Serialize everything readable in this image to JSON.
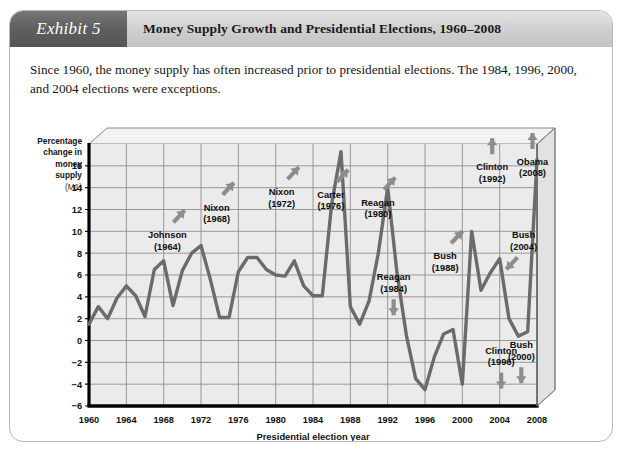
{
  "exhibit": {
    "badge_label": "Exhibit 5",
    "title": "Money Supply Growth and Presidential Elections, 1960–2008",
    "caption": "Since 1960, the money supply has often increased prior to presidential elections. The 1984, 1996, 2000, and 2004 elections were exceptions.",
    "badge_color": "#5e5e5e",
    "band_color": "#d2d2d2"
  },
  "chart_data": {
    "type": "line",
    "title": "Money Supply Growth and Presidential Elections, 1960–2008",
    "subtitle": "",
    "xlabel": "Presidential election year",
    "ylabel": "Percentage change in money supply (M1)",
    "ylabel_lines": [
      "Percentage",
      "change in",
      "money",
      "supply",
      "(M1)"
    ],
    "xlim": [
      1960,
      2008
    ],
    "ylim": [
      -6,
      18
    ],
    "xticks": [
      1960,
      1964,
      1968,
      1972,
      1976,
      1980,
      1984,
      1988,
      1992,
      1996,
      2000,
      2004,
      2008
    ],
    "yticks": [
      -6,
      -4,
      -2,
      0,
      2,
      4,
      6,
      8,
      10,
      12,
      14,
      16
    ],
    "grid": true,
    "legend": "none",
    "line_color": "#6b6b6b",
    "plot_bg": "#ebebeb",
    "series": [
      {
        "name": "Percentage change in money supply (M1)",
        "x": [
          1960,
          1961,
          1962,
          1963,
          1964,
          1965,
          1966,
          1967,
          1968,
          1969,
          1970,
          1971,
          1972,
          1973,
          1974,
          1975,
          1976,
          1977,
          1978,
          1979,
          1980,
          1981,
          1982,
          1983,
          1984,
          1985,
          1986,
          1987,
          1988,
          1989,
          1990,
          1991,
          1992,
          1993,
          1994,
          1995,
          1996,
          1997,
          1998,
          1999,
          2000,
          2001,
          2002,
          2003,
          2004,
          2005,
          2006,
          2007,
          2008
        ],
        "values": [
          1.5,
          3.1,
          2.0,
          3.9,
          5.0,
          4.1,
          2.2,
          6.5,
          7.3,
          3.2,
          6.4,
          8.0,
          8.7,
          5.6,
          2.1,
          2.1,
          6.3,
          7.6,
          7.6,
          6.5,
          6.0,
          5.9,
          7.3,
          5.0,
          4.1,
          4.1,
          12.5,
          17.3,
          3.1,
          1.5,
          3.6,
          8.0,
          14.0,
          6.2,
          0.5,
          -3.5,
          -4.5,
          -1.5,
          0.6,
          1.0,
          -4.0,
          10.0,
          4.6,
          6.2,
          7.5,
          2.0,
          0.4,
          0.8,
          16.6
        ]
      }
    ],
    "annotations": [
      {
        "label": "Johnson",
        "year": "(1964)",
        "x_pct": 17.5,
        "y_pct": 36.0,
        "arrow": "up-right"
      },
      {
        "label": "Nixon",
        "year": "(1968)",
        "x_pct": 28.5,
        "y_pct": 25.5,
        "arrow": "up-right"
      },
      {
        "label": "Nixon",
        "year": "(1972)",
        "x_pct": 43.0,
        "y_pct": 19.5,
        "arrow": "up-right"
      },
      {
        "label": "Carter",
        "year": "(1976)",
        "x_pct": 54.0,
        "y_pct": 20.5,
        "arrow": "up-right"
      },
      {
        "label": "Reagan",
        "year": "(1980)",
        "x_pct": 64.5,
        "y_pct": 23.5,
        "arrow": "up-right"
      },
      {
        "label": "Reagan",
        "year": "(1984)",
        "x_pct": 68.0,
        "y_pct": 52.0,
        "arrow": "down"
      },
      {
        "label": "Bush",
        "year": "(1988)",
        "x_pct": 79.5,
        "y_pct": 44.0,
        "arrow": "up-right"
      },
      {
        "label": "Clinton",
        "year": "(1992)",
        "x_pct": 90.0,
        "y_pct": 10.0,
        "arrow": "up"
      },
      {
        "label": "Clinton",
        "year": "(1996)",
        "x_pct": 92.0,
        "y_pct": 80.0,
        "arrow": "down"
      },
      {
        "label": "Bush",
        "year": "(2000)",
        "x_pct": 96.5,
        "y_pct": 78.0,
        "arrow": "down"
      },
      {
        "label": "Bush",
        "year": "(2004)",
        "x_pct": 97.0,
        "y_pct": 36.0,
        "arrow": "down-left"
      },
      {
        "label": "Obama",
        "year": "(2008)",
        "x_pct": 99.0,
        "y_pct": 8.0,
        "arrow": "up"
      }
    ]
  }
}
